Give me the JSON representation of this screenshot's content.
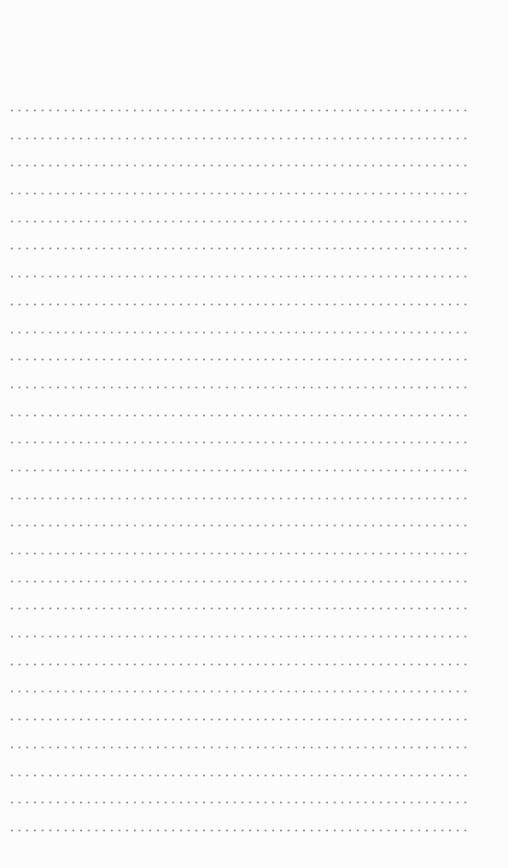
{
  "page": {
    "type": "dotted-line notepaper",
    "line_count": 27,
    "dot_color": "#8a8a8a",
    "background_color": "#fcfcfc",
    "lines": [
      {
        "text": ""
      },
      {
        "text": ""
      },
      {
        "text": ""
      },
      {
        "text": ""
      },
      {
        "text": ""
      },
      {
        "text": ""
      },
      {
        "text": ""
      },
      {
        "text": ""
      },
      {
        "text": ""
      },
      {
        "text": ""
      },
      {
        "text": ""
      },
      {
        "text": ""
      },
      {
        "text": ""
      },
      {
        "text": ""
      },
      {
        "text": ""
      },
      {
        "text": ""
      },
      {
        "text": ""
      },
      {
        "text": ""
      },
      {
        "text": ""
      },
      {
        "text": ""
      },
      {
        "text": ""
      },
      {
        "text": ""
      },
      {
        "text": ""
      },
      {
        "text": ""
      },
      {
        "text": ""
      },
      {
        "text": ""
      },
      {
        "text": ""
      }
    ]
  }
}
